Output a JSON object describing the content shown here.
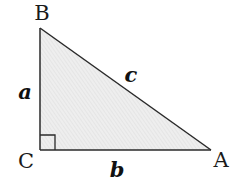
{
  "diagram": {
    "type": "right-triangle",
    "right_angle_at": "C",
    "vertices": [
      {
        "id": "A",
        "label": "A",
        "x": 211,
        "y": 150,
        "label_x": 221,
        "label_y": 167
      },
      {
        "id": "B",
        "label": "B",
        "x": 40,
        "y": 28,
        "label_x": 42,
        "label_y": 20
      },
      {
        "id": "C",
        "label": "C",
        "x": 40,
        "y": 150,
        "label_x": 26,
        "label_y": 168
      }
    ],
    "sides": [
      {
        "id": "a",
        "label": "a",
        "from": "B",
        "to": "C",
        "label_x": 25,
        "label_y": 99
      },
      {
        "id": "b",
        "label": "b",
        "from": "C",
        "to": "A",
        "label_x": 117,
        "label_y": 177
      },
      {
        "id": "c",
        "label": "c",
        "from": "B",
        "to": "A",
        "label_x": 131,
        "label_y": 82
      }
    ],
    "right_angle_marker_size": 15,
    "colors": {
      "stroke": "#2a2a2a",
      "fill": "#ececec",
      "hatch": "#dcdcdc"
    }
  }
}
